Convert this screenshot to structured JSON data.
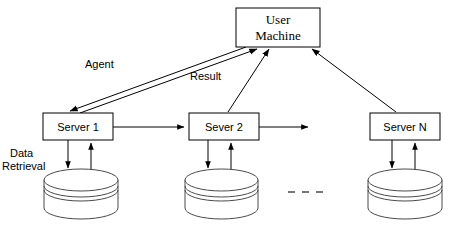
{
  "diagram": {
    "nodes": {
      "user_machine": {
        "label_line1": "User",
        "label_line2": "Machine",
        "name": "user-machine-box"
      },
      "server_1": {
        "label": "Server 1",
        "name": "server-1-box"
      },
      "server_2": {
        "label": "Sever 2",
        "name": "server-2-box"
      },
      "server_n": {
        "label": "Server N",
        "name": "server-n-box"
      },
      "database_1": {
        "name": "database-1-cylinder"
      },
      "database_2": {
        "name": "database-2-cylinder"
      },
      "database_n": {
        "name": "database-n-cylinder"
      }
    },
    "edge_labels": {
      "agent": "Agent",
      "result": "Result",
      "data_retrieval_line1": "Data",
      "data_retrieval_line2": "Retrieval"
    },
    "ellipsis": {
      "label": "…",
      "style": "dashed-horizontal"
    },
    "colors": {
      "stroke": "#000000",
      "cylinder_stroke": "#4a4a4a",
      "fill": "#ffffff",
      "background": "#ffffff"
    }
  }
}
